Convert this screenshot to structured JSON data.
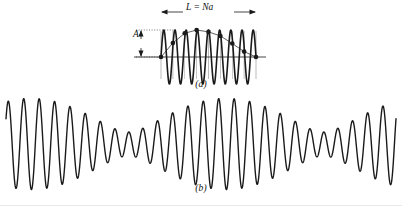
{
  "figure": {
    "background_color": "#ffffff",
    "ink_color": "#1a1a1a",
    "panels": [
      {
        "id": "a",
        "caption": "(a)",
        "length_label": "L = Na",
        "amplitude_label": "A",
        "description": "High-frequency sinusoid sampled at N equally spaced points; sample dots connected by a thin line reveal a slow aliased envelope."
      },
      {
        "id": "b",
        "caption": "(b)",
        "description": "Quasi-periodic beating waveform spanning the full figure width."
      }
    ]
  },
  "chart_data": [
    {
      "type": "line",
      "panel": "a",
      "title": "(a)",
      "xlabel": "L = Na",
      "ylabel": "A",
      "grid": false,
      "legend": "none",
      "axis": {
        "x_axis_visible": true,
        "xlim": [
          0,
          1
        ],
        "ylim": [
          -1.12,
          1.12
        ],
        "zero_line": true
      },
      "annotations": [
        {
          "text": "L = Na",
          "kind": "double-arrow-horizontal",
          "position": "top"
        },
        {
          "text": "A",
          "kind": "double-arrow-vertical",
          "position": "left"
        },
        {
          "text": "(a)",
          "kind": "caption",
          "position": "bottom-center"
        }
      ],
      "series": [
        {
          "name": "carrier",
          "kind": "dense-sinusoid",
          "stroke_width": 1.6,
          "cycles": 8.5,
          "amplitude": 1.0,
          "phase": 0.0,
          "samples_per_cycle": 40
        },
        {
          "name": "aliased-envelope",
          "kind": "sampled-points-connected",
          "stroke_width": 0.7,
          "marker": "filled-circle",
          "marker_size": 2.3,
          "n_points": 9,
          "x": [
            0.0,
            0.125,
            0.25,
            0.375,
            0.5,
            0.625,
            0.75,
            0.875,
            1.0
          ],
          "y": [
            0.0,
            0.52,
            0.88,
            1.0,
            0.93,
            0.78,
            0.5,
            0.2,
            0.0
          ]
        },
        {
          "name": "sample-drop-lines",
          "kind": "vertical-lines",
          "stroke_width": 0.5,
          "x": [
            0.0,
            0.125,
            0.25,
            0.375,
            0.5,
            0.625,
            0.75,
            0.875,
            1.0
          ],
          "extends_below_axis": true
        }
      ]
    },
    {
      "type": "line",
      "panel": "b",
      "title": "(b)",
      "xlabel": "",
      "ylabel": "",
      "grid": false,
      "legend": "none",
      "axis": {
        "x_axis_visible": false,
        "xlim": [
          0,
          1
        ],
        "ylim": [
          -1.15,
          1.15
        ]
      },
      "annotations": [
        {
          "text": "(b)",
          "kind": "caption",
          "position": "bottom-center"
        }
      ],
      "series": [
        {
          "name": "beating-waveform",
          "kind": "sum-of-two-sinusoids",
          "stroke_width": 1.4,
          "components": [
            {
              "cycles": 26.0,
              "amplitude": 0.72,
              "phase": 0.35
            },
            {
              "cycles": 24.0,
              "amplitude": 0.42,
              "phase": 1.15
            }
          ],
          "beat_periods": 2.0
        }
      ]
    }
  ]
}
